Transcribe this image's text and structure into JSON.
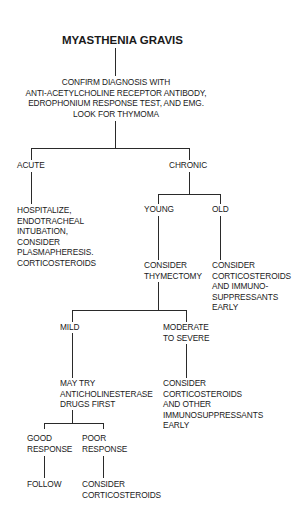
{
  "diagram": {
    "title": "MYASTHENIA GRAVIS",
    "confirm": {
      "lines": [
        "CONFIRM DIAGNOSIS WITH",
        "ANTI-ACETYLCHOLINE RECEPTOR ANTIBODY,",
        "EDROPHONIUM RESPONSE TEST, AND EMG.",
        "LOOK FOR THYMOMA"
      ]
    },
    "acute": {
      "label": "ACUTE",
      "action": [
        "HOSPITALIZE,",
        "ENDOTRACHEAL",
        "INTUBATION,",
        "CONSIDER",
        "PLASMAPHERESIS.",
        "CORTICOSTEROIDS"
      ]
    },
    "chronic": {
      "label": "CHRONIC",
      "young": {
        "label": "YOUNG",
        "action": [
          "CONSIDER",
          "THYMECTOMY"
        ],
        "mild": {
          "label": "MILD",
          "action": [
            "MAY TRY",
            "ANTICHOLINESTERASE",
            "DRUGS FIRST"
          ],
          "good": {
            "label": [
              "GOOD",
              "RESPONSE"
            ],
            "action": "FOLLOW"
          },
          "poor": {
            "label": [
              "POOR",
              "RESPONSE"
            ],
            "action": [
              "CONSIDER",
              "CORTICOSTEROIDS"
            ]
          }
        },
        "moderate": {
          "label": [
            "MODERATE",
            "TO SEVERE"
          ],
          "action": [
            "CONSIDER",
            "CORTICOSTEROIDS",
            "AND OTHER",
            "IMMUNOSUPPRESSANTS",
            "EARLY"
          ]
        }
      },
      "old": {
        "label": "OLD",
        "action": [
          "CONSIDER",
          "CORTICOSTEROIDS",
          "AND IMMUNO-",
          "SUPPRESSANTS",
          "EARLY"
        ]
      }
    }
  }
}
